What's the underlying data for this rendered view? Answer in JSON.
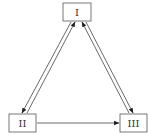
{
  "diagram": {
    "type": "state-transition",
    "nodes": [
      {
        "id": "I",
        "label": "I"
      },
      {
        "id": "II",
        "label": "II"
      },
      {
        "id": "III",
        "label": "III"
      }
    ],
    "edges": [
      {
        "from": "I",
        "to": "II"
      },
      {
        "from": "II",
        "to": "I"
      },
      {
        "from": "I",
        "to": "III"
      },
      {
        "from": "III",
        "to": "I"
      },
      {
        "from": "II",
        "to": "III"
      }
    ],
    "colors": {
      "line": "#444444",
      "box_border": "#555555",
      "background": "#ffffff"
    }
  }
}
